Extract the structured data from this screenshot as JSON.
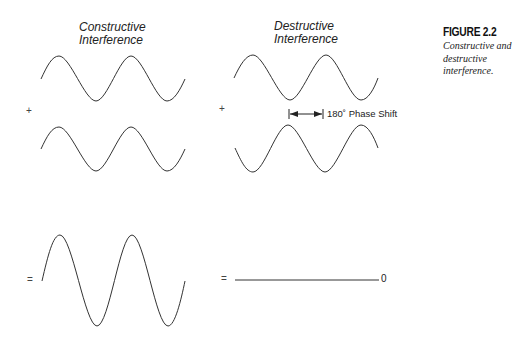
{
  "figure": {
    "number": "FIGURE 2.2",
    "caption": "Constructive and destructive interference."
  },
  "panels": {
    "constructive": {
      "title_line1": "Constructive",
      "title_line2": "Interference",
      "operator_plus": "+",
      "operator_equals": "="
    },
    "destructive": {
      "title_line1": "Destructive",
      "title_line2": "Interference",
      "operator_plus": "+",
      "operator_equals": "=",
      "phase_shift_label": "180˚ Phase Shift",
      "result_label": "0"
    }
  },
  "colors": {
    "line": "#333333",
    "text": "#222222"
  }
}
